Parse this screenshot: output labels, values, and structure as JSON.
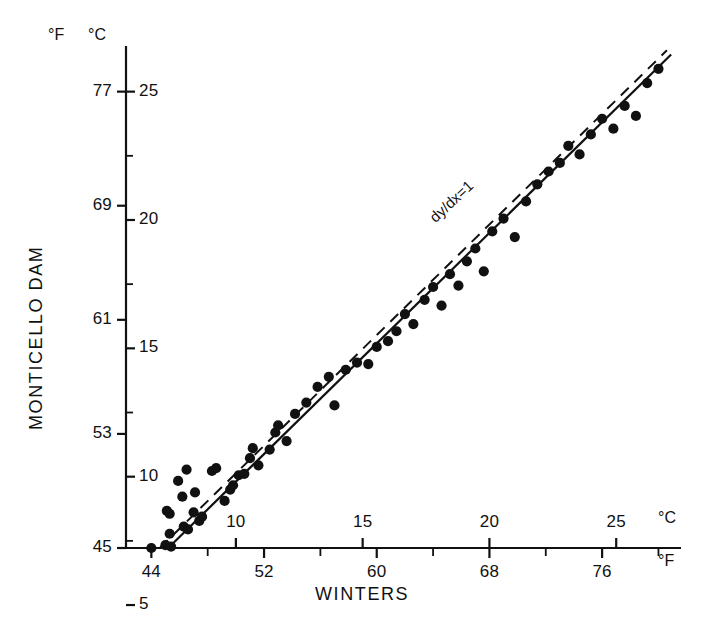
{
  "chart_data": {
    "type": "scatter",
    "title": "",
    "xlabel": "WINTERS",
    "ylabel": "MONTICELLO DAM",
    "x_unit_primary": "°C",
    "x_unit_secondary": "°F",
    "y_unit_primary": "°F",
    "y_unit_secondary": "°C",
    "grid": false,
    "legend": "none",
    "xlim_f": [
      42.2,
      81.6
    ],
    "ylim_f": [
      45.0,
      80.2
    ],
    "xlim_c": [
      5.7,
      27.6
    ],
    "ylim_c": [
      7.2,
      26.8
    ],
    "x_ticks_c": [
      5,
      10,
      15,
      20,
      25
    ],
    "x_ticks_f": [
      44,
      52,
      60,
      68,
      76
    ],
    "x_minor_ticks_f": [
      48,
      56,
      64,
      72,
      80
    ],
    "y_ticks_f": [
      45,
      53,
      61,
      69,
      77
    ],
    "y_ticks_c": [
      5,
      10,
      15,
      20,
      25
    ],
    "y_minor_ticks_c": [
      7.5,
      12.5,
      17.5,
      22.5
    ],
    "annotations": [
      {
        "text": "dy/dx=1",
        "x_f": 63.5,
        "y_f": 68.5,
        "rotation": -43
      }
    ],
    "lines": [
      {
        "name": "regression-line",
        "style": "solid",
        "x_start_f": 45.2,
        "y_start_f": 45.0,
        "x_end_f": 80.9,
        "y_end_f": 79.6
      },
      {
        "name": "unit-slope-line",
        "style": "dashed",
        "label": "dy/dx=1",
        "x_start_f": 44.6,
        "y_start_f": 45.0,
        "x_end_f": 80.6,
        "y_end_f": 79.9
      }
    ],
    "series": [
      {
        "name": "temperature-observations",
        "marker": "filled-circle",
        "color": "#111111",
        "point_count": 64,
        "points_f": [
          [
            44.0,
            45.0
          ],
          [
            45.0,
            45.2
          ],
          [
            45.4,
            45.1
          ],
          [
            45.3,
            46.0
          ],
          [
            45.1,
            47.6
          ],
          [
            45.3,
            47.4
          ],
          [
            45.9,
            49.7
          ],
          [
            46.2,
            48.6
          ],
          [
            46.5,
            50.5
          ],
          [
            46.3,
            46.5
          ],
          [
            46.6,
            46.3
          ],
          [
            47.0,
            47.5
          ],
          [
            47.1,
            48.9
          ],
          [
            47.4,
            46.9
          ],
          [
            47.6,
            47.2
          ],
          [
            48.3,
            50.4
          ],
          [
            48.6,
            50.6
          ],
          [
            49.2,
            48.3
          ],
          [
            49.6,
            49.1
          ],
          [
            49.8,
            49.4
          ],
          [
            50.2,
            50.1
          ],
          [
            50.6,
            50.2
          ],
          [
            51.0,
            51.3
          ],
          [
            51.2,
            52.0
          ],
          [
            51.6,
            50.8
          ],
          [
            52.4,
            51.9
          ],
          [
            52.8,
            53.1
          ],
          [
            53.0,
            53.6
          ],
          [
            53.6,
            52.5
          ],
          [
            54.2,
            54.4
          ],
          [
            55.0,
            55.2
          ],
          [
            55.8,
            56.3
          ],
          [
            56.6,
            57.0
          ],
          [
            57.0,
            55.0
          ],
          [
            57.8,
            57.5
          ],
          [
            58.6,
            58.0
          ],
          [
            59.4,
            57.9
          ],
          [
            60.0,
            59.1
          ],
          [
            60.8,
            59.5
          ],
          [
            61.4,
            60.2
          ],
          [
            62.0,
            61.4
          ],
          [
            62.6,
            60.7
          ],
          [
            63.4,
            62.4
          ],
          [
            64.0,
            63.3
          ],
          [
            64.6,
            62.0
          ],
          [
            65.2,
            64.2
          ],
          [
            65.8,
            63.4
          ],
          [
            66.4,
            65.1
          ],
          [
            67.0,
            66.0
          ],
          [
            67.6,
            64.4
          ],
          [
            68.2,
            67.2
          ],
          [
            69.0,
            68.1
          ],
          [
            69.8,
            66.8
          ],
          [
            70.6,
            69.3
          ],
          [
            71.4,
            70.5
          ],
          [
            72.2,
            71.4
          ],
          [
            73.0,
            72.0
          ],
          [
            73.6,
            73.2
          ],
          [
            74.4,
            72.6
          ],
          [
            75.2,
            74.0
          ],
          [
            76.0,
            75.1
          ],
          [
            76.8,
            74.4
          ],
          [
            77.6,
            76.0
          ],
          [
            78.4,
            75.3
          ],
          [
            79.2,
            77.6
          ],
          [
            80.0,
            78.6
          ]
        ]
      }
    ]
  }
}
